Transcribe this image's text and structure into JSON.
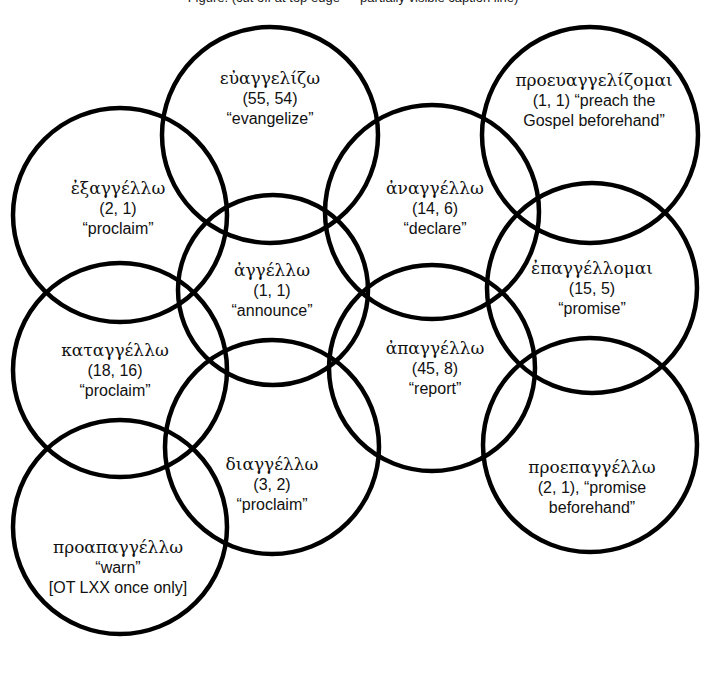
{
  "title": "Figure. (cut off at top edge — partially visible caption line)",
  "diagram": {
    "type": "venn-diagram",
    "stroke_color": "#000000",
    "background_color": "#ffffff",
    "count_note": "(NT occurrences, LXX occurrences)",
    "circles": [
      {
        "id": "exangello",
        "greek": "ἐξαγγέλλω",
        "counts": "(2, 1)",
        "gloss": "“proclaim”",
        "cx": 120,
        "cy": 215,
        "r": 107,
        "label_x": 118,
        "label_y": 208
      },
      {
        "id": "euangelizo",
        "greek": "εὐαγγελίζω",
        "counts": "(55, 54)",
        "gloss": "“evangelize”",
        "cx": 270,
        "cy": 135,
        "r": 108,
        "label_x": 270,
        "label_y": 98
      },
      {
        "id": "proeuangelizomai",
        "greek": "προευαγγελίζομαι",
        "counts": "(1, 1) “preach the",
        "gloss": "Gospel beforehand”",
        "cx": 590,
        "cy": 135,
        "r": 108,
        "label_x": 594,
        "label_y": 100
      },
      {
        "id": "anangello",
        "greek": "ἀναγγέλλω",
        "counts": "(14, 6)",
        "gloss": "“declare”",
        "cx": 432,
        "cy": 212,
        "r": 107,
        "label_x": 435,
        "label_y": 208
      },
      {
        "id": "epangellomai",
        "greek": "ἐπαγγέλλομαι",
        "counts": "(15, 5)",
        "gloss": "“promise”",
        "cx": 592,
        "cy": 288,
        "r": 105,
        "label_x": 592,
        "label_y": 288
      },
      {
        "id": "angello",
        "greek": "ἀγγέλλω",
        "counts": "(1, 1)",
        "gloss": "“announce”",
        "cx": 273,
        "cy": 290,
        "r": 95,
        "label_x": 272,
        "label_y": 290
      },
      {
        "id": "katangello",
        "greek": "καταγγέλλω",
        "counts": "(18, 16)",
        "gloss": "“proclaim”",
        "cx": 120,
        "cy": 370,
        "r": 107,
        "label_x": 115,
        "label_y": 370
      },
      {
        "id": "apangello",
        "greek": "ἀπαγγέλλω",
        "counts": "(45, 8)",
        "gloss": "“report”",
        "cx": 432,
        "cy": 368,
        "r": 103,
        "label_x": 435,
        "label_y": 368
      },
      {
        "id": "diangello",
        "greek": "διαγγέλλω",
        "counts": "(3, 2)",
        "gloss": "“proclaim”",
        "cx": 272,
        "cy": 447,
        "r": 107,
        "label_x": 272,
        "label_y": 484
      },
      {
        "id": "proepangello",
        "greek": "προεπαγγέλλω",
        "counts": "(2, 1), “promise",
        "gloss": "beforehand”",
        "cx": 590,
        "cy": 445,
        "r": 107,
        "label_x": 592,
        "label_y": 487
      },
      {
        "id": "proapangello",
        "greek": "προαπαγγέλλω",
        "counts": "“warn”",
        "gloss": "[OT LXX once only]",
        "cx": 120,
        "cy": 527,
        "r": 107,
        "label_x": 118,
        "label_y": 567
      }
    ]
  }
}
